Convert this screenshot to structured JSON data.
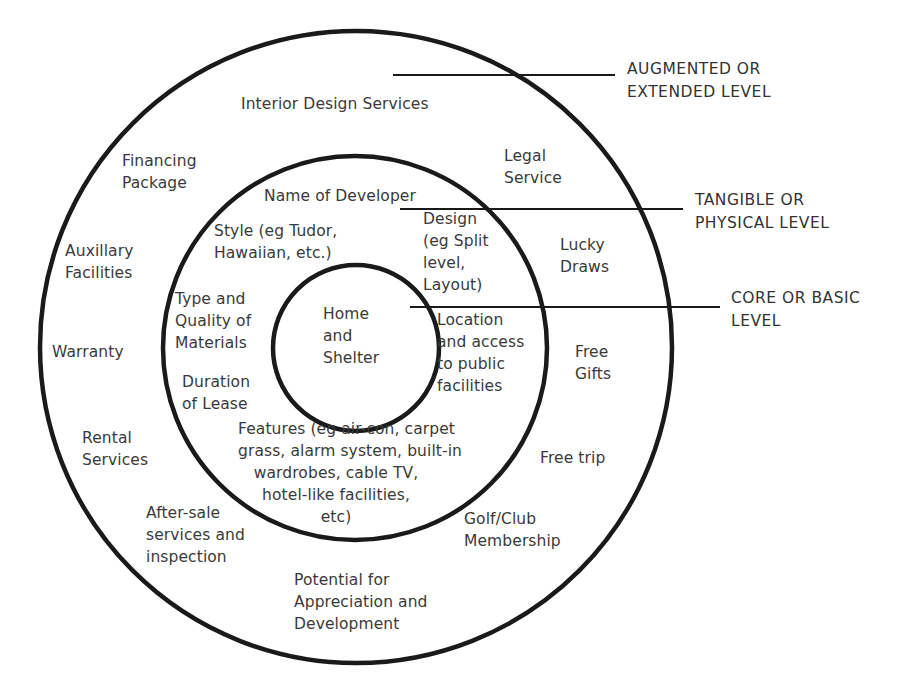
{
  "diagram": {
    "colors": {
      "stroke": "#1a1a1a",
      "text": "#3a3a3a",
      "background": "#ffffff"
    },
    "circles": [
      {
        "name": "augmented",
        "cx": 356,
        "cy": 347,
        "r": 316
      },
      {
        "name": "tangible",
        "cx": 355,
        "cy": 348,
        "r": 192
      },
      {
        "name": "core",
        "cx": 356,
        "cy": 348,
        "r": 83
      }
    ],
    "level_labels": [
      {
        "text": "AUGMENTED OR\nEXTENDED LEVEL",
        "line": {
          "x1": 393,
          "x2": 615,
          "y": 75
        }
      },
      {
        "text": "TANGIBLE OR\nPHYSICAL LEVEL",
        "line": {
          "x1": 400,
          "x2": 683,
          "y": 209
        }
      },
      {
        "text": "CORE OR BASIC\nLEVEL",
        "line": {
          "x1": 410,
          "x2": 720,
          "y": 307
        }
      }
    ],
    "core_items": [
      "Home\nand\nShelter"
    ],
    "tangible_items": [
      "Name of Developer",
      "Style (eg Tudor,\nHawaiian, etc.)",
      "Design\n(eg Split\nlevel,\nLayout)",
      "Type and\nQuality of\nMaterials",
      "Location\nand access\nto public\nfacilities",
      "Duration\nof Lease",
      "Features (eg air-con, carpet\ngrass, alarm system, built-in\nwardrobes, cable TV,\nhotel-like facilities,\netc)"
    ],
    "augmented_items": [
      "Interior Design Services",
      "Financing\nPackage",
      "Legal\nService",
      "Auxillary\nFacilities",
      "Lucky\nDraws",
      "Warranty",
      "Free\nGifts",
      "Rental\nServices",
      "Free trip",
      "After-sale\nservices and\ninspection",
      "Golf/Club\nMembership",
      "Potential for\nAppreciation and\nDevelopment"
    ]
  }
}
